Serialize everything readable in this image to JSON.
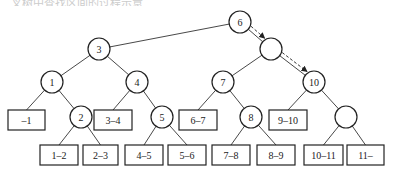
{
  "caption": "二叉树中查找区间的过程示意",
  "diagram": {
    "type": "binary-search-tree-of-intervals",
    "internal_nodes": [
      {
        "id": "n6",
        "label": "6",
        "x": 240,
        "y": 22
      },
      {
        "id": "n3",
        "label": "3",
        "x": 99,
        "y": 49
      },
      {
        "id": "nR",
        "label": "",
        "x": 271,
        "y": 49
      },
      {
        "id": "n1",
        "label": "1",
        "x": 52,
        "y": 82
      },
      {
        "id": "n4",
        "label": "4",
        "x": 137,
        "y": 82
      },
      {
        "id": "n7",
        "label": "7",
        "x": 223,
        "y": 82
      },
      {
        "id": "n10",
        "label": "10",
        "x": 314,
        "y": 82
      },
      {
        "id": "n2",
        "label": "2",
        "x": 81,
        "y": 117
      },
      {
        "id": "n5",
        "label": "5",
        "x": 162,
        "y": 117
      },
      {
        "id": "n8",
        "label": "8",
        "x": 251,
        "y": 117
      },
      {
        "id": "nE",
        "label": "",
        "x": 346,
        "y": 117
      }
    ],
    "leaves": [
      {
        "id": "l0",
        "label": "-1",
        "x": 8,
        "y": 110,
        "w": 37
      },
      {
        "id": "l1",
        "label": "1-2",
        "x": 40,
        "y": 145,
        "w": 38
      },
      {
        "id": "l2",
        "label": "2-3",
        "x": 83,
        "y": 145,
        "w": 35
      },
      {
        "id": "l3",
        "label": "3-4",
        "x": 94,
        "y": 110,
        "w": 38
      },
      {
        "id": "l4",
        "label": "4-5",
        "x": 125,
        "y": 145,
        "w": 38
      },
      {
        "id": "l5",
        "label": "5-6",
        "x": 168,
        "y": 145,
        "w": 38
      },
      {
        "id": "l6",
        "label": "6-7",
        "x": 179,
        "y": 110,
        "w": 38
      },
      {
        "id": "l7",
        "label": "7-8",
        "x": 212,
        "y": 145,
        "w": 38
      },
      {
        "id": "l8",
        "label": "8-9",
        "x": 257,
        "y": 145,
        "w": 38
      },
      {
        "id": "l9",
        "label": "9-10",
        "x": 269,
        "y": 110,
        "w": 38
      },
      {
        "id": "l10",
        "label": "10-11",
        "x": 304,
        "y": 145,
        "w": 39
      },
      {
        "id": "l11",
        "label": "11-",
        "x": 347,
        "y": 145,
        "w": 37
      }
    ],
    "edges": [
      [
        "n6",
        "n3"
      ],
      [
        "n6",
        "nR"
      ],
      [
        "n3",
        "n1"
      ],
      [
        "n3",
        "n4"
      ],
      [
        "nR",
        "n7"
      ],
      [
        "nR",
        "n10"
      ],
      [
        "n1",
        "l0"
      ],
      [
        "n1",
        "n2"
      ],
      [
        "n2",
        "l1"
      ],
      [
        "n2",
        "l2"
      ],
      [
        "n4",
        "l3"
      ],
      [
        "n4",
        "n5"
      ],
      [
        "n5",
        "l4"
      ],
      [
        "n5",
        "l5"
      ],
      [
        "n7",
        "l6"
      ],
      [
        "n7",
        "n8"
      ],
      [
        "n8",
        "l7"
      ],
      [
        "n8",
        "l8"
      ],
      [
        "n10",
        "l9"
      ],
      [
        "n10",
        "nE"
      ],
      [
        "nE",
        "l10"
      ],
      [
        "nE",
        "l11"
      ]
    ],
    "search_path": [
      "n6",
      "nR",
      "n10"
    ],
    "node_radius": 11,
    "leaf_height": 20
  }
}
